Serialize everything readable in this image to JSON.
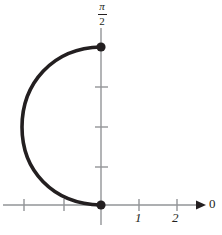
{
  "chart_data": {
    "type": "line",
    "title": "",
    "xlabel": "0",
    "ylabel": "",
    "grid": false,
    "legend": false,
    "background_color": "#ffffff",
    "curve_color": "#231f20",
    "axis_color": "#929497",
    "point_color": "#231f20",
    "x_axis": {
      "arrow": true,
      "arrow_label": "0",
      "tick_labels": [
        "",
        "",
        "1",
        "2"
      ],
      "labeled_ticks": [
        {
          "label": "1",
          "x_px": 139
        },
        {
          "label": "2",
          "x_px": 177
        }
      ],
      "tick_px": [
        24,
        64,
        139,
        177
      ],
      "origin_px": 101,
      "unit_px": 38,
      "start_px": 3,
      "end_px": 205
    },
    "y_axis": {
      "top_label": "π/2",
      "top_label_numerator": "π",
      "top_label_denominator": "2",
      "tick_px": [
        87,
        127,
        167
      ],
      "origin_px": 205,
      "top_px": 28,
      "bottom_px": 225,
      "value_at_top_dot": 1.5707963,
      "value_at_origin": 0
    },
    "points": [
      {
        "label": "π/2 endpoint",
        "x_px": 101,
        "y_px": 47,
        "x": 0,
        "y": 1.5707963,
        "marker": "filled-circle"
      },
      {
        "label": "origin endpoint",
        "x_px": 101,
        "y_px": 205,
        "x": 0,
        "y": 0,
        "marker": "filled-circle"
      }
    ],
    "series": [
      {
        "name": "arc",
        "description": "Thick semicircular arc bulging to the left, joining (0, pi/2) to (0, 0)",
        "leftmost_x_px": 22,
        "leftmost_y_px": 127,
        "path": "M 101 47 C 52 48 22 84 22 127 C 22 170 52 204 101 205",
        "x": [
          0.0,
          -0.55,
          -1.0,
          -1.3,
          -1.45,
          -1.5,
          -1.45,
          -1.3,
          -1.0,
          -0.55,
          0.0
        ],
        "y": [
          1.5707963,
          1.5396,
          1.4515,
          1.309,
          1.1107,
          0.8854,
          0.6601,
          0.4618,
          0.3193,
          0.2312,
          0.0
        ]
      }
    ]
  },
  "labels": {
    "x_tick_1": "1",
    "x_tick_2": "2",
    "axis_arrow_label": "0",
    "y_top_numerator": "π",
    "y_top_denominator": "2"
  }
}
